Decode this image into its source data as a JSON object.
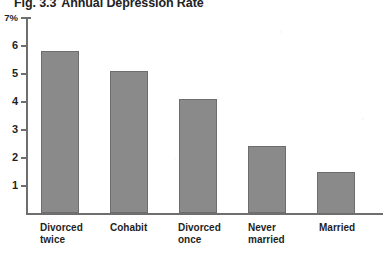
{
  "figure": {
    "label": "Fig. 3.3",
    "title": "Annual Depression Rate",
    "full_title": "Fig. 3.3  Annual Depression Rate"
  },
  "axis": {
    "y_top_label": "7%",
    "y_tick_labels": [
      "7%",
      "6",
      "5",
      "4",
      "3",
      "2",
      "1"
    ]
  },
  "colors": {
    "bar_fill": "#8a8a8a",
    "bar_stroke": "#6d6d6d",
    "axis": "#6e6e6e",
    "text": "#1f1f1f",
    "background": "#ffffff"
  },
  "chart_data": {
    "type": "bar",
    "xlabel": "",
    "ylabel": "",
    "ylim": [
      0,
      7
    ],
    "ytick_values": [
      1,
      2,
      3,
      4,
      5,
      6,
      7
    ],
    "ytick_labels": [
      "1",
      "2",
      "3",
      "4",
      "5",
      "6",
      "7%"
    ],
    "grid": false,
    "legend": "none",
    "units": "percent",
    "categories": [
      "Divorced\ntwice",
      "Cohabit",
      "Divorced\nonce",
      "Never\nmarried",
      "Married"
    ],
    "values": [
      5.8,
      5.1,
      4.1,
      2.4,
      1.5
    ],
    "bars": [
      {
        "category": "Divorced twice",
        "label_line1": "Divorced",
        "label_line2": "twice",
        "value": 5.8
      },
      {
        "category": "Cohabit",
        "label_line1": "Cohabit",
        "label_line2": "",
        "value": 5.1
      },
      {
        "category": "Divorced once",
        "label_line1": "Divorced",
        "label_line2": "once",
        "value": 4.1
      },
      {
        "category": "Never married",
        "label_line1": "Never",
        "label_line2": "married",
        "value": 2.4
      },
      {
        "category": "Married",
        "label_line1": "Married",
        "label_line2": "",
        "value": 1.5
      }
    ]
  }
}
